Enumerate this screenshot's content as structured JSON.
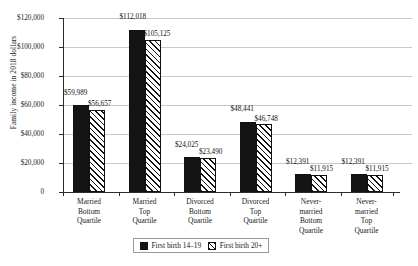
{
  "chart_data": {
    "type": "bar",
    "title": "",
    "xlabel": "",
    "ylabel": "Family income in 2018 dollars",
    "ylim": [
      0,
      120000
    ],
    "ytick_values": [
      0,
      20000,
      40000,
      60000,
      80000,
      100000,
      120000
    ],
    "ytick_labels": [
      "0",
      "$20,000",
      "$40,000",
      "$60,000",
      "$80,000",
      "$100,000",
      "$120,000"
    ],
    "grid": true,
    "legend_position": "bottom",
    "categories": [
      "Married Bottom Quartile",
      "Married Top Quartile",
      "Divorced Bottom Quartile",
      "Divorced Top Quartile",
      "Never-married Bottom Quartile",
      "Never-married Top Quartile"
    ],
    "category_lines": [
      [
        "Married",
        "Bottom",
        "Quartile"
      ],
      [
        "Married",
        "Top",
        "Quartile"
      ],
      [
        "Divorced",
        "Bottom",
        "Quartile"
      ],
      [
        "Divorced",
        "Top",
        "Quartile"
      ],
      [
        "Never-",
        "married",
        "Bottom",
        "Quartile"
      ],
      [
        "Never-",
        "married",
        "Top",
        "Quartile"
      ]
    ],
    "series": [
      {
        "name": "First birth 14–19",
        "fill": "solid",
        "color": "#141414",
        "values": [
          59989,
          112018,
          24025,
          48441,
          12391,
          12391
        ],
        "value_labels": [
          "$59,989",
          "$112,018",
          "$24,025",
          "$48,441",
          "$12,391",
          "$12,391"
        ]
      },
      {
        "name": "First birth 20+",
        "fill": "hatched",
        "color": "#ffffff",
        "values": [
          56657,
          105125,
          23490,
          46748,
          11915,
          11915
        ],
        "value_labels": [
          "$56,657",
          "$105,125",
          "$23,490",
          "$46,748",
          "$11,915",
          "$11,915"
        ]
      }
    ]
  },
  "legend": {
    "items": [
      {
        "label": "First birth 14–19",
        "fill": "solid"
      },
      {
        "label": "First birth 20+",
        "fill": "hatched"
      }
    ]
  }
}
